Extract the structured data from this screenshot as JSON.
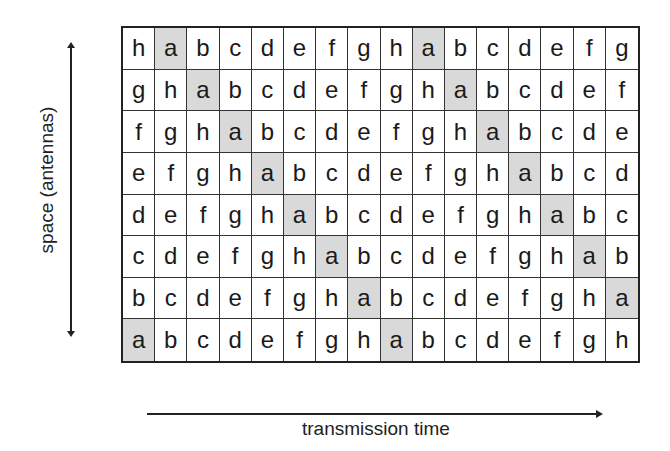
{
  "figure": {
    "y_axis_label": "space (antennas)",
    "x_axis_label": "transmission time",
    "highlight_symbol": "a",
    "highlight_color": "#d9d9d9",
    "rows": [
      [
        "h",
        "a",
        "b",
        "c",
        "d",
        "e",
        "f",
        "g",
        "h",
        "a",
        "b",
        "c",
        "d",
        "e",
        "f",
        "g"
      ],
      [
        "g",
        "h",
        "a",
        "b",
        "c",
        "d",
        "e",
        "f",
        "g",
        "h",
        "a",
        "b",
        "c",
        "d",
        "e",
        "f"
      ],
      [
        "f",
        "g",
        "h",
        "a",
        "b",
        "c",
        "d",
        "e",
        "f",
        "g",
        "h",
        "a",
        "b",
        "c",
        "d",
        "e"
      ],
      [
        "e",
        "f",
        "g",
        "h",
        "a",
        "b",
        "c",
        "d",
        "e",
        "f",
        "g",
        "h",
        "a",
        "b",
        "c",
        "d"
      ],
      [
        "d",
        "e",
        "f",
        "g",
        "h",
        "a",
        "b",
        "c",
        "d",
        "e",
        "f",
        "g",
        "h",
        "a",
        "b",
        "c"
      ],
      [
        "c",
        "d",
        "e",
        "f",
        "g",
        "h",
        "a",
        "b",
        "c",
        "d",
        "e",
        "f",
        "g",
        "h",
        "a",
        "b"
      ],
      [
        "b",
        "c",
        "d",
        "e",
        "f",
        "g",
        "h",
        "a",
        "b",
        "c",
        "d",
        "e",
        "f",
        "g",
        "h",
        "a"
      ],
      [
        "a",
        "b",
        "c",
        "d",
        "e",
        "f",
        "g",
        "h",
        "a",
        "b",
        "c",
        "d",
        "e",
        "f",
        "g",
        "h"
      ]
    ]
  }
}
